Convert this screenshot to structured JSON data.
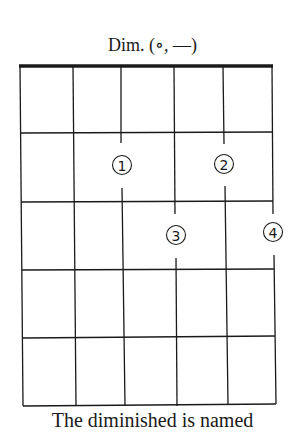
{
  "diagram": {
    "title": "Dim. (∘, —)",
    "caption": "The diminished is named",
    "strings": 6,
    "frets": 5,
    "fingers": [
      {
        "label": "①",
        "number": 1,
        "string": 3,
        "fret": 2
      },
      {
        "label": "②",
        "number": 2,
        "string": 5,
        "fret": 2
      },
      {
        "label": "③",
        "number": 3,
        "string": 4,
        "fret": 3
      },
      {
        "label": "④",
        "number": 4,
        "string": 6,
        "fret": 3
      }
    ]
  }
}
